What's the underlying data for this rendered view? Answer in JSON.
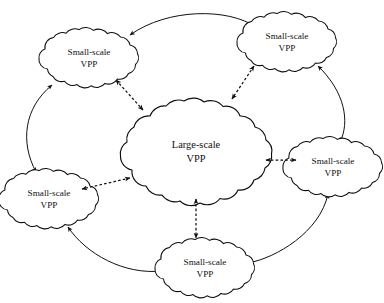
{
  "figure": {
    "caption_remnant": "",
    "background_color": "#ffffff",
    "line_color": "#111111"
  },
  "nodes": {
    "center": {
      "id": "large-scale-vpp",
      "line1": "Large-scale",
      "line2": "VPP",
      "size": "large",
      "cx": 196,
      "cy": 152
    },
    "satellites": [
      {
        "id": "small-scale-vpp-top-left",
        "line1": "Small-scale",
        "line2": "VPP",
        "size": "small",
        "cx": 89,
        "cy": 58
      },
      {
        "id": "small-scale-vpp-top-right",
        "line1": "Small-scale",
        "line2": "VPP",
        "size": "small",
        "cx": 287,
        "cy": 42
      },
      {
        "id": "small-scale-vpp-right",
        "line1": "Small-scale",
        "line2": "VPP",
        "size": "small",
        "cx": 333,
        "cy": 167
      },
      {
        "id": "small-scale-vpp-bottom",
        "line1": "Small-scale",
        "line2": "VPP",
        "size": "small",
        "cx": 205,
        "cy": 268
      },
      {
        "id": "small-scale-vpp-left",
        "line1": "Small-scale",
        "line2": "VPP",
        "size": "small",
        "cx": 49,
        "cy": 199
      }
    ]
  },
  "edges": {
    "radial_dashed": [
      {
        "id": "edge-center-top-left",
        "style": "dashed",
        "arrows": "both"
      },
      {
        "id": "edge-center-top-right",
        "style": "dashed",
        "arrows": "both"
      },
      {
        "id": "edge-center-right",
        "style": "dashed",
        "arrows": "both"
      },
      {
        "id": "edge-center-bottom",
        "style": "dashed",
        "arrows": "both"
      },
      {
        "id": "edge-center-left",
        "style": "dashed",
        "arrows": "both"
      }
    ],
    "ring_solid": [
      {
        "id": "edge-ring-top-left-to-top-right",
        "style": "solid",
        "arrows": "both"
      },
      {
        "id": "edge-ring-top-right-to-right",
        "style": "solid",
        "arrows": "both"
      },
      {
        "id": "edge-ring-right-to-bottom",
        "style": "solid",
        "arrows": "both"
      },
      {
        "id": "edge-ring-bottom-to-left",
        "style": "solid",
        "arrows": "both"
      },
      {
        "id": "edge-ring-left-to-top-left",
        "style": "solid",
        "arrows": "both"
      }
    ]
  }
}
